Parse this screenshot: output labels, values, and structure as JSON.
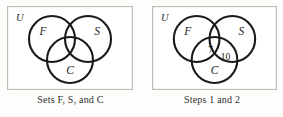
{
  "figure": {
    "type": "venn-diagram-pair",
    "background_color": "#fdfdfc",
    "circle_stroke_color": "#1a1a1a",
    "box_stroke_color": "#b9b9b4"
  },
  "panels": [
    {
      "id": "left",
      "universe_label": "U",
      "caption_prefix": "Sets ",
      "caption_set_1": "F",
      "caption_sep_1": ", ",
      "caption_set_2": "S",
      "caption_sep_2": ", and ",
      "caption_set_3": "C",
      "caption_plain": "Sets F, S, and C",
      "sets": [
        {
          "key": "F",
          "label": "F",
          "position": "upper-left"
        },
        {
          "key": "S",
          "label": "S",
          "position": "upper-right"
        },
        {
          "key": "C",
          "label": "C",
          "position": "bottom-center"
        }
      ],
      "region_counts": []
    },
    {
      "id": "right",
      "universe_label": "U",
      "caption_plain": "Steps 1 and 2",
      "sets": [
        {
          "key": "F",
          "label": "F",
          "position": "upper-left"
        },
        {
          "key": "S",
          "label": "S",
          "position": "upper-right"
        },
        {
          "key": "C",
          "label": "C",
          "position": "bottom-center"
        }
      ],
      "region_counts": [
        {
          "region": "F-and-S",
          "value": "7"
        },
        {
          "region": "S-and-C",
          "value": "10"
        }
      ]
    }
  ]
}
